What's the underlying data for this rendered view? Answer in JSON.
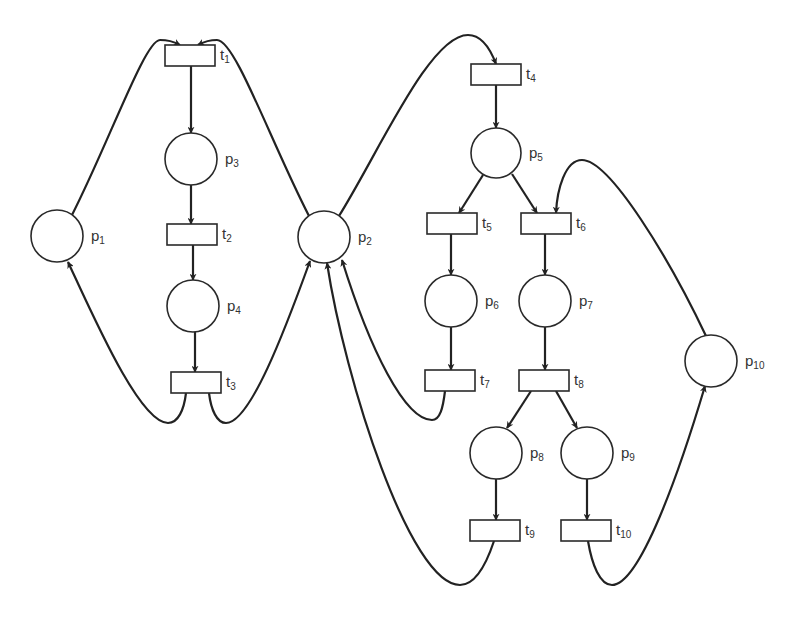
{
  "diagram": {
    "type": "petri-net",
    "places": [
      {
        "id": "p1",
        "name": "p",
        "sub": "1",
        "cx": 57,
        "cy": 236,
        "r": 26
      },
      {
        "id": "p2",
        "name": "p",
        "sub": "2",
        "cx": 324,
        "cy": 237,
        "r": 26
      },
      {
        "id": "p3",
        "name": "p",
        "sub": "3",
        "cx": 191,
        "cy": 159,
        "r": 26
      },
      {
        "id": "p4",
        "name": "p",
        "sub": "4",
        "cx": 193,
        "cy": 306,
        "r": 26
      },
      {
        "id": "p5",
        "name": "p",
        "sub": "5",
        "cx": 496,
        "cy": 153,
        "r": 25
      },
      {
        "id": "p6",
        "name": "p",
        "sub": "6",
        "cx": 451,
        "cy": 301,
        "r": 26
      },
      {
        "id": "p7",
        "name": "p",
        "sub": "7",
        "cx": 545,
        "cy": 301,
        "r": 26
      },
      {
        "id": "p8",
        "name": "p",
        "sub": "8",
        "cx": 496,
        "cy": 453,
        "r": 26
      },
      {
        "id": "p9",
        "name": "p",
        "sub": "9",
        "cx": 587,
        "cy": 453,
        "r": 26
      },
      {
        "id": "p10",
        "name": "p",
        "sub": "10",
        "cx": 711,
        "cy": 361,
        "r": 26
      }
    ],
    "transitions": [
      {
        "id": "t1",
        "name": "t",
        "sub": "1",
        "x": 165,
        "y": 45,
        "w": 50,
        "h": 21
      },
      {
        "id": "t2",
        "name": "t",
        "sub": "2",
        "x": 167,
        "y": 224,
        "w": 50,
        "h": 21
      },
      {
        "id": "t3",
        "name": "t",
        "sub": "3",
        "x": 171,
        "y": 372,
        "w": 50,
        "h": 21
      },
      {
        "id": "t4",
        "name": "t",
        "sub": "4",
        "x": 471,
        "y": 64,
        "w": 50,
        "h": 21
      },
      {
        "id": "t5",
        "name": "t",
        "sub": "5",
        "x": 427,
        "y": 213,
        "w": 50,
        "h": 21
      },
      {
        "id": "t6",
        "name": "t",
        "sub": "6",
        "x": 521,
        "y": 213,
        "w": 50,
        "h": 21
      },
      {
        "id": "t7",
        "name": "t",
        "sub": "7",
        "x": 425,
        "y": 370,
        "w": 50,
        "h": 21
      },
      {
        "id": "t8",
        "name": "t",
        "sub": "8",
        "x": 519,
        "y": 370,
        "w": 50,
        "h": 21
      },
      {
        "id": "t9",
        "name": "t",
        "sub": "9",
        "x": 470,
        "y": 520,
        "w": 50,
        "h": 21
      },
      {
        "id": "t10",
        "name": "t",
        "sub": "10",
        "x": 561,
        "y": 520,
        "w": 50,
        "h": 21
      }
    ],
    "arcs": [
      {
        "from": "p1",
        "to": "t1",
        "d": "M72,215 C110,140 145,40 160,40 C172,40 178,44 180,45"
      },
      {
        "from": "p2",
        "to": "t1",
        "d": "M309,216 C270,140 235,40 217,40 C206,40 200,44 198,45"
      },
      {
        "from": "t1",
        "to": "p3",
        "d": "M191,66 L191,133"
      },
      {
        "from": "p3",
        "to": "t2",
        "d": "M191,185 L191,224"
      },
      {
        "from": "t2",
        "to": "p4",
        "d": "M193,245 L193,280"
      },
      {
        "from": "p4",
        "to": "t3",
        "d": "M195,332 L195,372"
      },
      {
        "from": "t3",
        "to": "p1",
        "d": "M186,393 C184,410 178,423 168,423 C140,423 95,320 68,262"
      },
      {
        "from": "t3",
        "to": "p2",
        "d": "M209,393 C211,410 217,423 226,423 C250,423 285,330 310,261"
      },
      {
        "from": "p2",
        "to": "t4",
        "d": "M339,216 C380,150 430,35 468,35 C482,35 490,48 496,64"
      },
      {
        "from": "t4",
        "to": "p5",
        "d": "M496,85 L496,128"
      },
      {
        "from": "p5",
        "to": "t5",
        "d": "M483,175 L459,213"
      },
      {
        "from": "p5",
        "to": "t6",
        "d": "M512,174 L537,213"
      },
      {
        "from": "p10",
        "to": "t6",
        "d": "M706,336 C670,260 610,160 582,160 C565,160 557,190 556,213"
      },
      {
        "from": "t5",
        "to": "p6",
        "d": "M451,234 L451,275"
      },
      {
        "from": "t6",
        "to": "p7",
        "d": "M545,234 L545,275"
      },
      {
        "from": "p6",
        "to": "t7",
        "d": "M451,327 L451,370"
      },
      {
        "from": "p7",
        "to": "t8",
        "d": "M545,327 L545,370"
      },
      {
        "from": "t7",
        "to": "p2",
        "d": "M445,391 C443,408 440,420 432,420 C405,420 370,350 342,260"
      },
      {
        "from": "t8",
        "to": "p8",
        "d": "M531,391 L507,428"
      },
      {
        "from": "t8",
        "to": "p9",
        "d": "M556,391 L577,428"
      },
      {
        "from": "p8",
        "to": "t9",
        "d": "M496,479 L496,520"
      },
      {
        "from": "p9",
        "to": "t10",
        "d": "M587,479 L587,520"
      },
      {
        "from": "t9",
        "to": "p2",
        "d": "M494,541 C486,565 475,585 460,585 C410,585 345,380 327,263"
      },
      {
        "from": "t10",
        "to": "p10",
        "d": "M588,541 C592,565 600,585 612,585 C640,585 680,470 705,386"
      }
    ]
  }
}
